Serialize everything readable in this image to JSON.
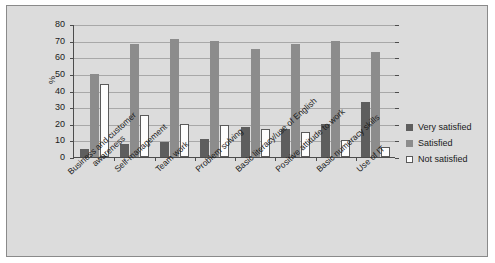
{
  "chart_data": {
    "type": "bar",
    "title": "",
    "subtitle": "",
    "xlabel": "",
    "ylabel": "%",
    "ylim": [
      0,
      80
    ],
    "ytick_step": 10,
    "yticks": [
      0,
      10,
      20,
      30,
      40,
      50,
      60,
      70,
      80
    ],
    "grid": true,
    "legend_position": "right",
    "categories": [
      "Business and customer\nawareness",
      "Self-management",
      "Team work",
      "Problem solving",
      "Basic literacy/use of English",
      "Positive attitude to work",
      "Basic numeracy skills",
      "Use of IT"
    ],
    "series": [
      {
        "name": "Very satisfied",
        "color": "#5e5e5e",
        "values": [
          5,
          8,
          9,
          11,
          18,
          17,
          20,
          33
        ]
      },
      {
        "name": "Satisfied",
        "color": "#8c8c8c",
        "values": [
          50,
          68,
          71,
          70,
          65,
          68,
          70,
          63
        ]
      },
      {
        "name": "Not satisfied",
        "color": "#ffffff",
        "values": [
          44,
          25,
          20,
          19,
          17,
          15,
          10,
          6
        ]
      }
    ]
  },
  "legend": {
    "items": [
      {
        "label": "Very satisfied"
      },
      {
        "label": "Satisfied"
      },
      {
        "label": "Not satisfied"
      }
    ]
  },
  "axis": {
    "y_title": "%"
  },
  "colors": {
    "background": "#dcdcdc",
    "page": "#ffffff",
    "frame_border": "#8a8a8a",
    "axis": "#4c4c4c",
    "gridline": "#a8a8a8",
    "text": "#1a1a1a"
  }
}
